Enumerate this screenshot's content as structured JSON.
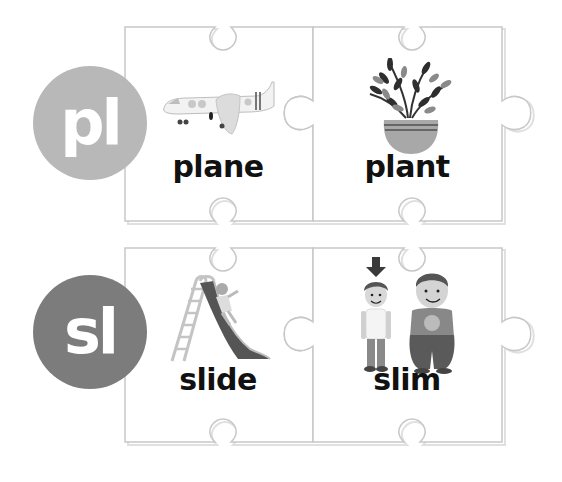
{
  "rows": [
    {
      "blend": "pl",
      "circle_color": "#b8b8b8",
      "cards": [
        {
          "word": "plane",
          "picture": "airplane-icon"
        },
        {
          "word": "plant",
          "picture": "potted-plant-icon"
        }
      ]
    },
    {
      "blend": "sl",
      "circle_color": "#7c7c7c",
      "cards": [
        {
          "word": "slide",
          "picture": "slide-icon"
        },
        {
          "word": "slim",
          "picture": "slim-boy-icon"
        }
      ]
    }
  ],
  "colors": {
    "outline": "#c8c8c8",
    "shadow": "#e0e0e0",
    "text": "#111111"
  }
}
